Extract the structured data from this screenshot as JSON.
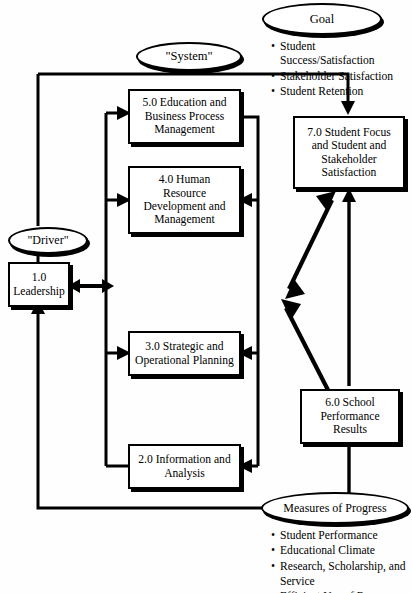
{
  "diagram": {
    "line_color": "#000000",
    "box_fill": "#ffffff"
  },
  "goal": {
    "label": "Goal",
    "bullets": [
      "Student Success/Satisfaction",
      "Stakeholder Satisfaction",
      "Student Retention"
    ]
  },
  "system": {
    "label": "\"System\""
  },
  "driver": {
    "label": "\"Driver\""
  },
  "measures": {
    "label": "Measures of Progress",
    "bullets": [
      "Student Performance",
      "Educational Climate",
      "Research, Scholarship, and"
    ],
    "continuation": "Service",
    "clipped": "Efficient Use of Resources"
  },
  "boxes": {
    "leadership": {
      "id": "1.0",
      "line1": "1.0",
      "line2": "Leadership"
    },
    "information": {
      "id": "2.0",
      "line1": "2.0 Information and",
      "line2": "Analysis"
    },
    "planning": {
      "id": "3.0",
      "line1": "3.0 Strategic and",
      "line2": "Operational Planning"
    },
    "human_resource": {
      "id": "4.0",
      "line1": "4.0 Human",
      "line2": "Resource",
      "line3": "Development and",
      "line4": "Management"
    },
    "education": {
      "id": "5.0",
      "line1": "5.0 Education and",
      "line2": "Business Process",
      "line3": "Management"
    },
    "school_results": {
      "id": "6.0",
      "line1": "6.0 School",
      "line2": "Performance",
      "line3": "Results"
    },
    "student_focus": {
      "id": "7.0",
      "line1": "7.0  Student Focus",
      "line2": "and Student and",
      "line3": "Stakeholder",
      "line4": "Satisfaction"
    }
  }
}
